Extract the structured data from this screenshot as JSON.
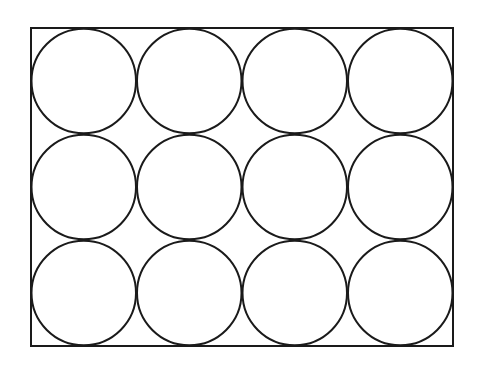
{
  "diagram": {
    "rectangle": {
      "x": 31,
      "y": 28,
      "width": 422,
      "height": 318
    },
    "grid": {
      "columns": 4,
      "rows": 3
    },
    "circle_radius": 52.75,
    "stroke_color": "#1a1a1a",
    "fill_color": "#ffffff"
  }
}
